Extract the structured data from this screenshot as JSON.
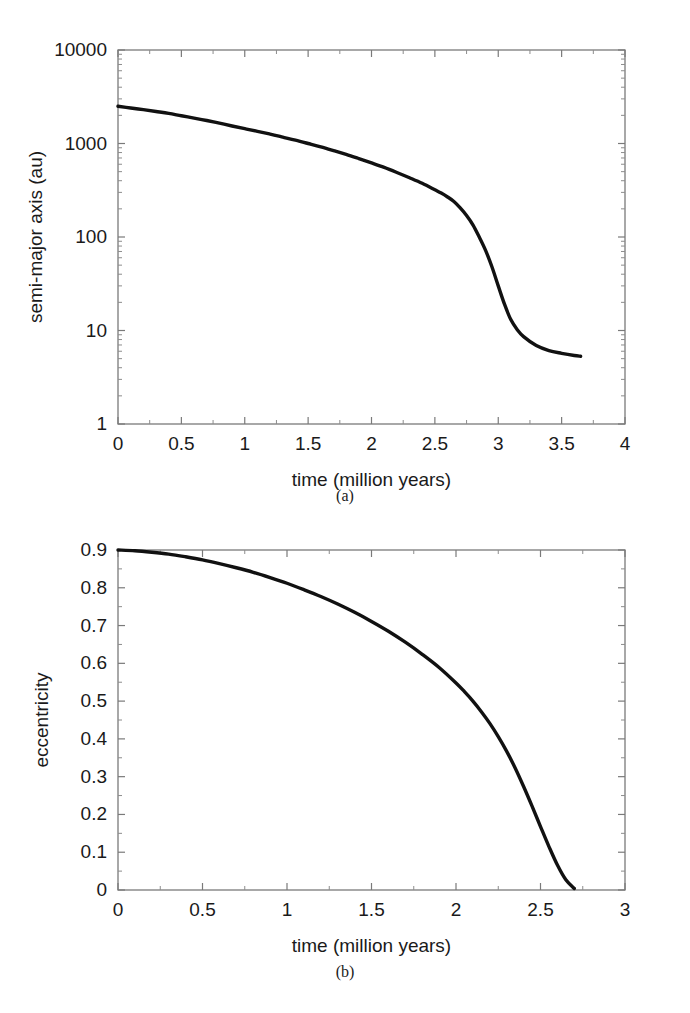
{
  "figure": {
    "panels": [
      {
        "caption": "(a)"
      },
      {
        "caption": "(b)"
      }
    ]
  },
  "chart_data": [
    {
      "type": "line",
      "panel": "(a)",
      "title": "",
      "xlabel": "time (million years)",
      "ylabel": "semi-major axis (au)",
      "xscale": "linear",
      "yscale": "log",
      "xlim": [
        0,
        4
      ],
      "ylim": [
        1,
        10000
      ],
      "grid": false,
      "legend": null,
      "xticks": [
        0,
        0.5,
        1,
        1.5,
        2,
        2.5,
        3,
        3.5,
        4
      ],
      "xticklabels": [
        "0",
        "0.5",
        "1",
        "1.5",
        "2",
        "2.5",
        "3",
        "3.5",
        "4"
      ],
      "yticks": [
        1,
        10,
        100,
        1000,
        10000
      ],
      "yticklabels": [
        "1",
        "10",
        "100",
        "1000",
        "10000"
      ],
      "series": [
        {
          "name": "semi-major axis",
          "x": [
            0,
            0.1,
            0.2,
            0.3,
            0.4,
            0.5,
            0.6,
            0.7,
            0.8,
            0.9,
            1.0,
            1.1,
            1.2,
            1.3,
            1.4,
            1.5,
            1.6,
            1.7,
            1.8,
            1.9,
            2.0,
            2.1,
            2.2,
            2.3,
            2.4,
            2.5,
            2.55,
            2.6,
            2.65,
            2.7,
            2.75,
            2.8,
            2.85,
            2.9,
            2.95,
            3.0,
            3.05,
            3.1,
            3.15,
            3.2,
            3.3,
            3.4,
            3.5,
            3.6,
            3.65
          ],
          "y": [
            2500,
            2400,
            2300,
            2200,
            2100,
            1980,
            1870,
            1760,
            1650,
            1540,
            1440,
            1350,
            1260,
            1170,
            1085,
            1000,
            920,
            840,
            765,
            690,
            620,
            555,
            490,
            430,
            375,
            320,
            295,
            268,
            240,
            205,
            170,
            135,
            100,
            72,
            48,
            30,
            19,
            13,
            10.2,
            8.6,
            6.9,
            6.1,
            5.7,
            5.4,
            5.3
          ]
        }
      ]
    },
    {
      "type": "line",
      "panel": "(b)",
      "title": "",
      "xlabel": "time (million years)",
      "ylabel": "eccentricity",
      "xscale": "linear",
      "yscale": "linear",
      "xlim": [
        0,
        3
      ],
      "ylim": [
        0,
        0.9
      ],
      "grid": false,
      "legend": null,
      "xticks": [
        0,
        0.5,
        1,
        1.5,
        2,
        2.5,
        3
      ],
      "xticklabels": [
        "0",
        "0.5",
        "1",
        "1.5",
        "2",
        "2.5",
        "3"
      ],
      "yticks": [
        0,
        0.1,
        0.2,
        0.3,
        0.4,
        0.5,
        0.6,
        0.7,
        0.8,
        0.9
      ],
      "yticklabels": [
        "0",
        "0.1",
        "0.2",
        "0.3",
        "0.4",
        "0.5",
        "0.6",
        "0.7",
        "0.8",
        "0.9"
      ],
      "series": [
        {
          "name": "eccentricity",
          "x": [
            0,
            0.1,
            0.2,
            0.3,
            0.4,
            0.5,
            0.6,
            0.7,
            0.8,
            0.9,
            1.0,
            1.1,
            1.2,
            1.3,
            1.4,
            1.5,
            1.6,
            1.7,
            1.8,
            1.9,
            2.0,
            2.05,
            2.1,
            2.15,
            2.2,
            2.25,
            2.3,
            2.35,
            2.4,
            2.45,
            2.5,
            2.55,
            2.6,
            2.65,
            2.7
          ],
          "y": [
            0.9,
            0.898,
            0.894,
            0.889,
            0.882,
            0.874,
            0.864,
            0.853,
            0.841,
            0.827,
            0.812,
            0.795,
            0.777,
            0.757,
            0.735,
            0.711,
            0.685,
            0.656,
            0.624,
            0.589,
            0.548,
            0.525,
            0.5,
            0.472,
            0.441,
            0.406,
            0.367,
            0.323,
            0.274,
            0.222,
            0.168,
            0.115,
            0.066,
            0.027,
            0.004
          ]
        }
      ]
    }
  ]
}
